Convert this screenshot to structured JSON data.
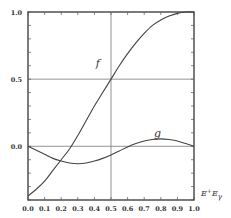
{
  "chart_data": {
    "type": "line",
    "title": "",
    "xlabel": "E⁺/E_γ",
    "xlabel_main": "E",
    "xlabel_sup": "+",
    "xlabel_mid": "E",
    "xlabel_sub": "γ",
    "ylabel": "",
    "xlim": [
      0.0,
      1.0
    ],
    "ylim": [
      -0.4,
      1.0
    ],
    "grid": false,
    "reference_lines": {
      "vertical_x": 0.5,
      "horizontal_y": [
        0.5,
        0.0
      ]
    },
    "x_tick_labels": [
      "0.0",
      "0.1",
      "0.2",
      "0.3",
      "0.4",
      "0.5",
      "0.6",
      "0.7",
      "0.8",
      "0.9",
      "1.0"
    ],
    "y_tick_labels": [
      {
        "value": 1.0,
        "label": "1.0"
      },
      {
        "value": 0.5,
        "label": "0.5"
      },
      {
        "value": 0.0,
        "label": "0.0"
      }
    ],
    "series": [
      {
        "name": "f",
        "label": "f",
        "x": [
          0.0,
          0.05,
          0.1,
          0.15,
          0.2,
          0.25,
          0.3,
          0.35,
          0.4,
          0.45,
          0.5,
          0.55,
          0.6,
          0.65,
          0.7,
          0.75,
          0.8,
          0.85,
          0.9,
          0.95,
          1.0
        ],
        "values": [
          -0.37,
          -0.32,
          -0.26,
          -0.18,
          -0.1,
          -0.02,
          0.08,
          0.19,
          0.3,
          0.4,
          0.5,
          0.6,
          0.69,
          0.77,
          0.84,
          0.9,
          0.94,
          0.97,
          0.99,
          1.0,
          1.0
        ]
      },
      {
        "name": "g",
        "label": "g",
        "x": [
          0.0,
          0.05,
          0.1,
          0.15,
          0.2,
          0.25,
          0.3,
          0.35,
          0.4,
          0.45,
          0.5,
          0.55,
          0.6,
          0.65,
          0.7,
          0.75,
          0.8,
          0.85,
          0.9,
          0.95,
          1.0
        ],
        "values": [
          0.0,
          -0.03,
          -0.06,
          -0.09,
          -0.11,
          -0.125,
          -0.13,
          -0.125,
          -0.11,
          -0.09,
          -0.065,
          -0.035,
          -0.005,
          0.02,
          0.04,
          0.05,
          0.055,
          0.05,
          0.04,
          0.02,
          0.0
        ]
      }
    ],
    "annotations": [
      {
        "text": "f",
        "x": 0.42,
        "y": 0.59
      },
      {
        "text": "g",
        "x": 0.78,
        "y": 0.07
      }
    ]
  }
}
